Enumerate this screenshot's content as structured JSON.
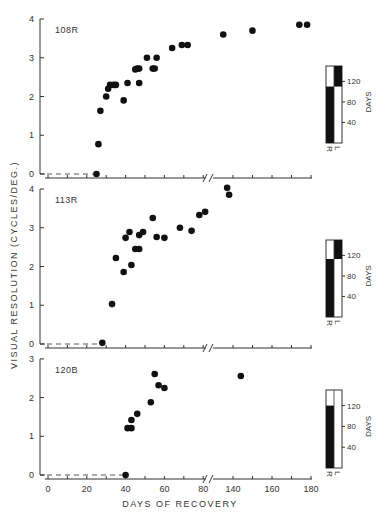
{
  "chart_data": {
    "type": "scatter",
    "xlabel": "DAYS OF RECOVERY",
    "ylabel": "VISUAL RESOLUTION (CYCLES/DEG.)",
    "x_ticks": [
      0,
      20,
      40,
      60,
      80,
      140,
      160,
      180
    ],
    "x_axis_break": [
      80,
      130
    ],
    "grid": false,
    "panels": [
      {
        "title": "108R",
        "ylim": [
          0,
          4
        ],
        "y_ticks": [
          0,
          1,
          2,
          3,
          4
        ],
        "baseline_dashed_until_day": 25,
        "points": [
          [
            25,
            0.0
          ],
          [
            26,
            0.77
          ],
          [
            27,
            1.63
          ],
          [
            30,
            2.0
          ],
          [
            31,
            2.2
          ],
          [
            32,
            2.3
          ],
          [
            34,
            2.3
          ],
          [
            35,
            2.3
          ],
          [
            39,
            1.9
          ],
          [
            41,
            2.35
          ],
          [
            45,
            2.7
          ],
          [
            46,
            2.72
          ],
          [
            47,
            2.72
          ],
          [
            47,
            2.35
          ],
          [
            51,
            3.0
          ],
          [
            54,
            2.72
          ],
          [
            55,
            2.72
          ],
          [
            56,
            3.0
          ],
          [
            64,
            3.25
          ],
          [
            69,
            3.33
          ],
          [
            72,
            3.33
          ],
          [
            135,
            3.6
          ],
          [
            150,
            3.7
          ],
          [
            174,
            3.85
          ],
          [
            178,
            3.85
          ]
        ],
        "occlusion_bar": {
          "axis_label": "DAYS",
          "ticks": [
            40,
            80,
            120
          ],
          "columns": [
            "R",
            "L"
          ],
          "R_black_from": 0,
          "R_black_to": 110,
          "L_black_from": 110,
          "L_black_to": 150,
          "top": 150
        }
      },
      {
        "title": "113R",
        "ylim": [
          0,
          4
        ],
        "y_ticks": [
          0,
          1,
          2,
          3,
          4
        ],
        "baseline_dashed_until_day": 28,
        "points": [
          [
            28,
            0.03
          ],
          [
            33,
            1.03
          ],
          [
            35,
            2.22
          ],
          [
            39,
            1.86
          ],
          [
            40,
            2.74
          ],
          [
            42,
            2.89
          ],
          [
            43,
            2.04
          ],
          [
            45,
            2.45
          ],
          [
            47,
            2.45
          ],
          [
            47,
            2.81
          ],
          [
            49,
            2.89
          ],
          [
            54,
            3.25
          ],
          [
            56,
            2.76
          ],
          [
            60,
            2.74
          ],
          [
            68,
            3.0
          ],
          [
            74,
            2.92
          ],
          [
            78,
            3.33
          ],
          [
            81,
            3.41
          ],
          [
            137,
            4.03
          ],
          [
            138,
            3.85
          ]
        ],
        "occlusion_bar": {
          "axis_label": "DAYS",
          "ticks": [
            40,
            80,
            120
          ],
          "columns": [
            "R",
            "L"
          ],
          "R_black_from": 0,
          "R_black_to": 113,
          "L_black_from": 113,
          "L_black_to": 150,
          "top": 150
        }
      },
      {
        "title": "120B",
        "ylim": [
          0,
          3
        ],
        "y_ticks": [
          0,
          1,
          2,
          3
        ],
        "baseline_dashed_until_day": 40,
        "points": [
          [
            40,
            0.0
          ],
          [
            41,
            1.21
          ],
          [
            43,
            1.21
          ],
          [
            43,
            1.42
          ],
          [
            46,
            1.58
          ],
          [
            53,
            1.88
          ],
          [
            55,
            2.61
          ],
          [
            57,
            2.32
          ],
          [
            60,
            2.25
          ],
          [
            144,
            2.56
          ]
        ],
        "occlusion_bar": {
          "axis_label": "DAYS",
          "ticks": [
            40,
            80,
            120
          ],
          "columns": [
            "R",
            "L"
          ],
          "R_black_from": 0,
          "R_black_to": 120,
          "L_black_from": 0,
          "L_black_to": 0,
          "top": 150
        }
      }
    ]
  },
  "labels": {
    "ylabel": "VISUAL   RESOLUTION (CYCLES/DEG.)",
    "xlabel": "DAYS   OF   RECOVERY",
    "bar_axis": "DAYS",
    "bar_R": "R",
    "bar_L": "L"
  }
}
